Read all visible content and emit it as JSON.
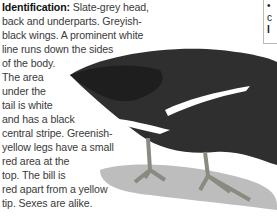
{
  "article": {
    "heading": "Identification:",
    "lines": [
      " Slate-grey head,",
      "back and underparts. Greyish-",
      "black wings. A prominent white",
      "line runs down the sides",
      "of the body.",
      "The area",
      "under the",
      "tail is white",
      "and has a black",
      "central stripe. Greenish-",
      "yellow legs have a small",
      "red area at the",
      "top. The bill is",
      "red apart from a yellow",
      "tip. Sexes are alike."
    ]
  },
  "sidebox": {
    "lines": [
      "•",
      "c",
      "I"
    ]
  },
  "illustration": {
    "subject": "moorhen-bird",
    "colors": {
      "body": "#2e2e2e",
      "wing": "#1f1f1f",
      "stripe": "#ffffff",
      "shadow": "#b8b8b8",
      "legs": "#8a8a80"
    }
  }
}
